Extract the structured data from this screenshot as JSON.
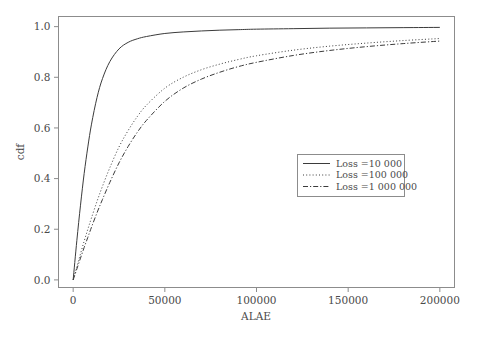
{
  "chart_data": {
    "type": "line",
    "title": "",
    "xlabel": "ALAE",
    "ylabel": "cdf",
    "xlim": [
      -8000,
      208000
    ],
    "ylim": [
      -0.03,
      1.04
    ],
    "grid": false,
    "legend_position": "center-right",
    "xticks": [
      0,
      50000,
      100000,
      150000,
      200000
    ],
    "xtick_labels": [
      "0",
      "50000",
      "100000",
      "150000",
      "200000"
    ],
    "yticks": [
      0.0,
      0.2,
      0.4,
      0.6,
      0.8,
      1.0
    ],
    "ytick_labels": [
      "0.0",
      "0.2",
      "0.4",
      "0.6",
      "0.8",
      "1.0"
    ],
    "x": [
      0,
      2000,
      4000,
      6000,
      8000,
      10000,
      13000,
      16000,
      20000,
      25000,
      30000,
      35000,
      40000,
      50000,
      60000,
      70000,
      80000,
      90000,
      100000,
      120000,
      140000,
      160000,
      180000,
      200000
    ],
    "series": [
      {
        "name": "Loss =10 000",
        "style": "solid",
        "values": [
          0.0,
          0.155,
          0.295,
          0.42,
          0.525,
          0.615,
          0.72,
          0.795,
          0.862,
          0.912,
          0.938,
          0.952,
          0.961,
          0.973,
          0.979,
          0.983,
          0.986,
          0.988,
          0.99,
          0.992,
          0.994,
          0.995,
          0.996,
          0.997
        ]
      },
      {
        "name": "Loss =100 000",
        "style": "dotted",
        "values": [
          0.0,
          0.052,
          0.103,
          0.153,
          0.2,
          0.245,
          0.31,
          0.37,
          0.443,
          0.525,
          0.59,
          0.645,
          0.69,
          0.757,
          0.8,
          0.83,
          0.852,
          0.87,
          0.885,
          0.907,
          0.923,
          0.935,
          0.945,
          0.953
        ]
      },
      {
        "name": "Loss =1 000 000",
        "style": "dashdot",
        "values": [
          0.0,
          0.043,
          0.086,
          0.128,
          0.168,
          0.208,
          0.265,
          0.318,
          0.385,
          0.462,
          0.527,
          0.583,
          0.63,
          0.705,
          0.757,
          0.793,
          0.82,
          0.842,
          0.859,
          0.886,
          0.906,
          0.921,
          0.933,
          0.943
        ]
      }
    ]
  },
  "legend": {
    "entries": [
      {
        "label": "Loss =10 000"
      },
      {
        "label": "Loss =100 000"
      },
      {
        "label": "Loss =1 000 000"
      }
    ]
  },
  "colors": {
    "background": "#ffffff",
    "axis": "#8c8c8c",
    "curve": "#3b3b3b",
    "text": "#4a4a4a"
  }
}
